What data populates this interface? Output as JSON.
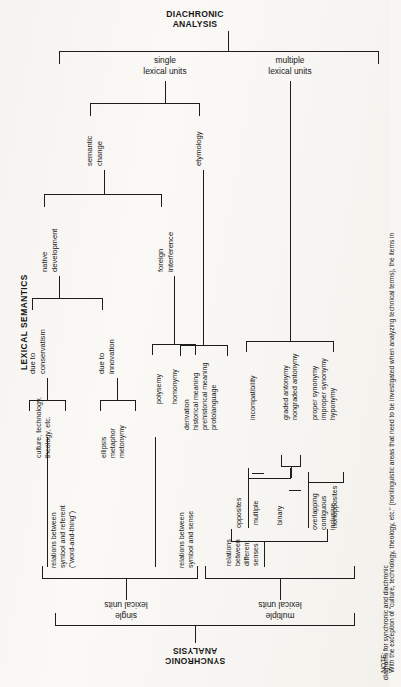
{
  "figure": {
    "side_label": "LEXICAL SEMANTICS",
    "top_title_line1": "DIACHRONIC",
    "top_title_line2": "ANALYSIS",
    "bottom_title_line1": "SYNCHRONIC",
    "bottom_title_line2": "ANALYSIS",
    "note_label": "NOTE:",
    "note_text": "With the exception of \"culture, technology, theology, etc.\" (nonlinguistic areas that need to be investigated when analyzing technical terms), the items in",
    "note_text_2": "diagrams for synchronic and diachronic"
  },
  "diachronic": {
    "branch_single_l1": "single",
    "branch_single_l2": "lexical units",
    "branch_multiple_l1": "multiple",
    "branch_multiple_l2": "lexical units",
    "semantic_change_l1": "semantic",
    "semantic_change_l2": "change",
    "etymology": "etymology",
    "native_development_l1": "native",
    "native_development_l2": "development",
    "foreign_interference_l1": "foreign",
    "foreign_interference_l2": "interference",
    "due_to_conservatism_l1": "due to",
    "due_to_conservatism_l2": "conservatism",
    "due_to_innovation_l1": "due to",
    "due_to_innovation_l2": "innovation",
    "culture_l1": "culture, technology,",
    "culture_l2": "theology, etc.",
    "ellipsis": "ellipsis",
    "metaphor": "metaphor",
    "metonymy": "metonymy",
    "polysemy": "polysemy",
    "homonymy": "homonymy",
    "derivation": "derivation",
    "historical_meaning": "historical meaning",
    "prehistorical_meaning": "prehistorical meaning",
    "protolanguage": "protolanguage"
  },
  "synchronic": {
    "branch_single_l1": "single",
    "branch_single_l2": "lexical units",
    "branch_multiple_l1": "multiple",
    "branch_multiple_l2": "lexical units",
    "relations_symbol_referent_l1": "relations between",
    "relations_symbol_referent_l2": "symbol and referent",
    "relations_symbol_referent_l3": "(\"word-and-thing\")",
    "relations_symbol_sense_l1": "relations between",
    "relations_symbol_sense_l2": "symbol and sense",
    "relations_diff_senses_l1": "relations",
    "relations_diff_senses_l2": "between",
    "relations_diff_senses_l3": "different",
    "relations_diff_senses_l4": "senses",
    "opposites": "opposites",
    "nonopposites": "nonopposites",
    "multiple": "multiple",
    "binary": "binary",
    "overlapping": "overlapping",
    "contiguous": "contiguous",
    "inclusive": "inclusive",
    "incompatibility": "incompatibility",
    "graded_antonymy": "graded antonymy",
    "nongraded_antonymy": "nongraded antonymy",
    "proper_synonymy": "proper synonymy",
    "improper_synonymy": "improper synonymy",
    "hyponymy": "hyponymy"
  }
}
